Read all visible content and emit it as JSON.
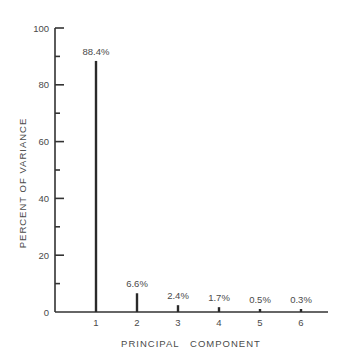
{
  "chart_data": {
    "type": "bar",
    "title": "",
    "xlabel": "PRINCIPAL   COMPONENT",
    "ylabel": "PERCENT   OF   VARIANCE",
    "categories": [
      "1",
      "2",
      "3",
      "4",
      "5",
      "6"
    ],
    "values": [
      88.4,
      6.6,
      2.4,
      1.7,
      0.5,
      0.3
    ],
    "value_labels": [
      "88.4%",
      "6.6%",
      "2.4%",
      "1.7%",
      "0.5%",
      "0.3%"
    ],
    "ylim": [
      0,
      100
    ],
    "yticks_major": [
      0,
      20,
      40,
      60,
      80,
      100
    ],
    "yticks_minor": [
      10,
      30,
      50,
      70,
      90
    ],
    "ytick_labels": [
      "0",
      "20",
      "40",
      "60",
      "80",
      "100"
    ],
    "grid": false,
    "legend": null,
    "bar_style": "thin vertical lines (spike plot)",
    "colors": {
      "bars": "#2a2a2a",
      "axes": "#333333",
      "text": "#4a4a4a",
      "background": "#ffffff"
    }
  }
}
